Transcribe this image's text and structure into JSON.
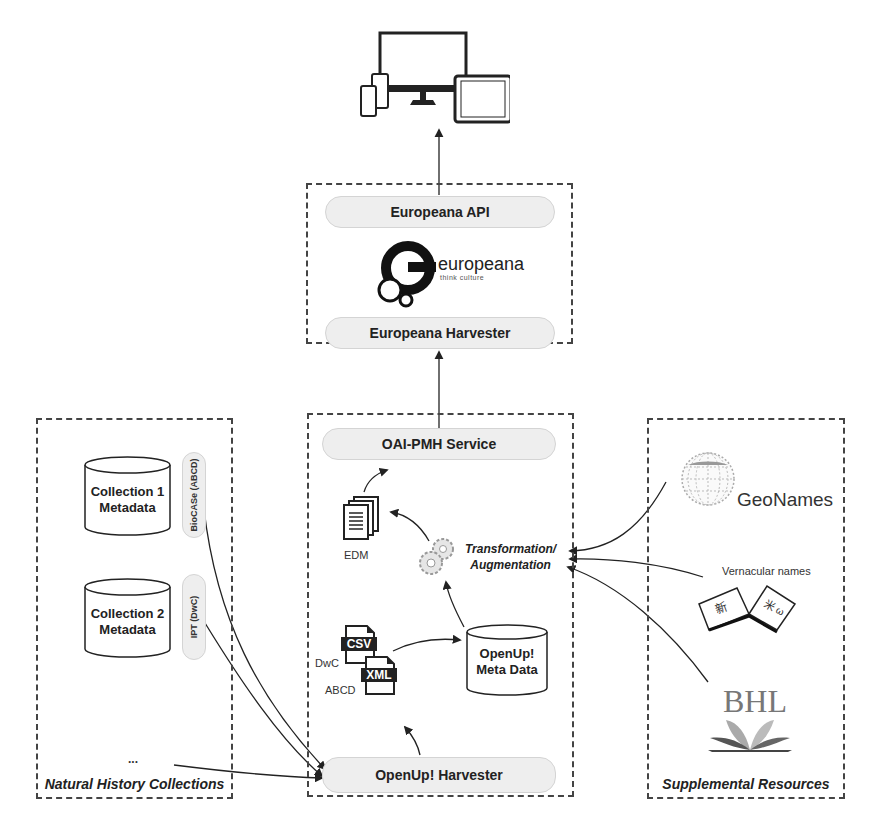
{
  "consumer": {
    "icon": "multi-device-icon",
    "devices": [
      "desktop-monitor",
      "tablet",
      "phone",
      "phone"
    ]
  },
  "europeana_box": {
    "api_label": "Europeana API",
    "logo_text": "europeana",
    "logo_tagline": "think culture",
    "harvester_label": "Europeana Harvester"
  },
  "collections_box": {
    "title": "Natural History Collections",
    "collection1": {
      "line1": "Collection 1",
      "line2": "Metadata",
      "service": "BioCASe (ABCD)"
    },
    "collection2": {
      "line1": "Collection 2",
      "line2": "Metadata",
      "service": "IPT (DwC)"
    },
    "more": "..."
  },
  "aggregator_box": {
    "title": "Natural History Aggregator",
    "oai_label": "OAI-PMH Service",
    "edm_label": "EDM",
    "transform_line1": "Transformation/",
    "transform_line2": "Augmentation",
    "csv_badge": "CSV",
    "xml_badge": "XML",
    "dwc_label": "DwC",
    "abcd_label": "ABCD",
    "metadata_line1": "OpenUp!",
    "metadata_line2": "Meta Data",
    "harvester_label": "OpenUp! Harvester"
  },
  "supplemental_box": {
    "title": "Supplemental Resources",
    "geonames_label": "GeoNames",
    "vernacular_label": "Vernacular names",
    "bhl_label": "BHL"
  },
  "colors": {
    "border": "#444444",
    "pill_fill": "#eeeeee",
    "text": "#222222"
  }
}
